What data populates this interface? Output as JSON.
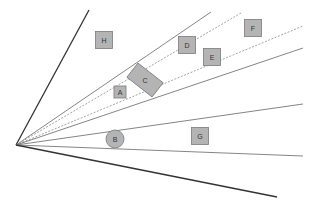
{
  "diagram": {
    "origin": {
      "x": 16,
      "y": 145
    },
    "rays": [
      {
        "id": "ray-1",
        "to": [
          89,
          10
        ],
        "style": "solid-dark"
      },
      {
        "id": "ray-2",
        "to": [
          211,
          12
        ],
        "style": "solid"
      },
      {
        "id": "ray-3",
        "to": [
          241,
          13
        ],
        "style": "dashed"
      },
      {
        "id": "ray-4",
        "to": [
          303,
          26
        ],
        "style": "dashed"
      },
      {
        "id": "ray-5",
        "to": [
          303,
          48
        ],
        "style": "solid"
      },
      {
        "id": "ray-6",
        "to": [
          303,
          104
        ],
        "style": "solid"
      },
      {
        "id": "ray-7",
        "to": [
          303,
          156
        ],
        "style": "solid"
      },
      {
        "id": "ray-8",
        "to": [
          277,
          197
        ],
        "style": "solid-dark"
      }
    ],
    "objects": [
      {
        "label": "H",
        "shape": "square",
        "cx": 104,
        "cy": 40,
        "size": 17
      },
      {
        "label": "D",
        "shape": "square",
        "cx": 187,
        "cy": 45,
        "size": 17
      },
      {
        "label": "F",
        "shape": "square",
        "cx": 253,
        "cy": 28,
        "size": 17
      },
      {
        "label": "E",
        "shape": "square",
        "cx": 212,
        "cy": 57,
        "size": 17
      },
      {
        "label": "C",
        "shape": "rect-rotated",
        "cx": 145,
        "cy": 80,
        "w": 32,
        "h": 18,
        "angle": 38
      },
      {
        "label": "A",
        "shape": "square",
        "cx": 120,
        "cy": 92,
        "size": 12
      },
      {
        "label": "B",
        "shape": "circle",
        "cx": 115,
        "cy": 139,
        "r": 9
      },
      {
        "label": "G",
        "shape": "square",
        "cx": 200,
        "cy": 136,
        "size": 17
      }
    ],
    "colors": {
      "fill": "#b4b4b4",
      "stroke": "#7a7a7a",
      "line": "#777777",
      "dark_line": "#333333"
    }
  }
}
